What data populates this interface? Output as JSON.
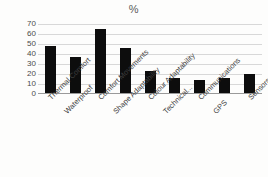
{
  "chart_data": {
    "type": "bar",
    "title": "%",
    "xlabel": "",
    "ylabel": "",
    "ylim": [
      0,
      70
    ],
    "yticks": [
      0,
      10,
      20,
      30,
      40,
      50,
      60,
      70
    ],
    "grid": true,
    "legend": "none",
    "bar_color": "#0d0d0d",
    "gridline_color": "#d8d8d8",
    "categories": [
      "Thermal Comfort",
      "Waterproof",
      "Comfort Movements",
      "Shape Adaptability",
      "Colour Adaptability",
      "Technical...",
      "Communications",
      "GPS",
      "Sensors Introduction"
    ],
    "values": [
      48,
      37,
      65,
      46,
      22,
      15,
      13,
      15,
      19
    ]
  }
}
